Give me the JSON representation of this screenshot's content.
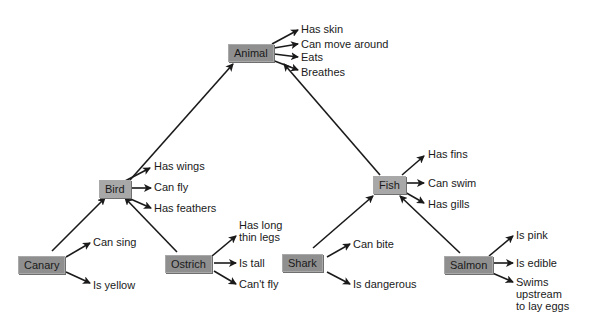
{
  "diagram": {
    "type": "semantic-network",
    "colors": {
      "node_fill": "#8f8f8f",
      "node_fill_light": "#a8a8a8",
      "line": "#1a1a1a",
      "background": "#ffffff"
    },
    "nodes": {
      "animal": {
        "label": "Animal",
        "properties": [
          "Has skin",
          "Can move around",
          "Eats",
          "Breathes"
        ]
      },
      "bird": {
        "label": "Bird",
        "properties": [
          "Has wings",
          "Can fly",
          "Has feathers"
        ]
      },
      "fish": {
        "label": "Fish",
        "properties": [
          "Has fins",
          "Can swim",
          "Has gills"
        ]
      },
      "canary": {
        "label": "Canary",
        "properties": [
          "Can sing",
          "Is yellow"
        ]
      },
      "ostrich": {
        "label": "Ostrich",
        "properties": [
          "Has long\nthin legs",
          "Is tall",
          "Can't fly"
        ]
      },
      "shark": {
        "label": "Shark",
        "properties": [
          "Can bite",
          "Is dangerous"
        ]
      },
      "salmon": {
        "label": "Salmon",
        "properties": [
          "Is pink",
          "Is edible",
          "Swims\nupstream\nto lay eggs"
        ]
      }
    },
    "hierarchy": [
      [
        "bird",
        "animal"
      ],
      [
        "fish",
        "animal"
      ],
      [
        "canary",
        "bird"
      ],
      [
        "ostrich",
        "bird"
      ],
      [
        "shark",
        "fish"
      ],
      [
        "salmon",
        "fish"
      ]
    ]
  }
}
